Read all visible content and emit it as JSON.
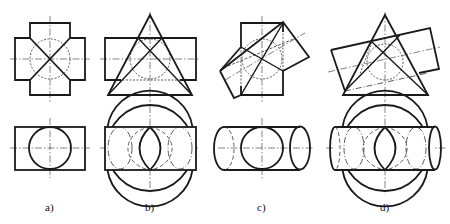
{
  "figure": {
    "title": "",
    "panels": [
      {
        "id": "a",
        "label": "a)",
        "description": "Cylinder-cylinder intersection (equal diameters, perpendicular axes): front view with X-shaped intersection lines, side view circle in rectangle"
      },
      {
        "id": "b",
        "label": "b)",
        "description": "Cone and cylinder intersection sharing an inscribed sphere: front view triangle with rectangle, top view circle with lens-shaped curves"
      },
      {
        "id": "c",
        "label": "c)",
        "description": "Two cylinders with inclined axes tangent to common sphere: front view with rotated rectangle, top view cylinder with elliptical ends"
      },
      {
        "id": "d",
        "label": "d)",
        "description": "Cone and inclined cylinder tangent to common sphere: front view triangle with tilted rectangle, top view circle with cylinder and ellipses"
      }
    ]
  },
  "colors": {
    "line": "#1a1a1a",
    "background": "#ffffff"
  }
}
